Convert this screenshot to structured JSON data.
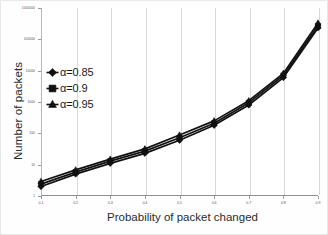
{
  "chart_data": {
    "type": "line",
    "title": "",
    "xlabel": "Probability of  packet  changed",
    "ylabel": "Number of packets",
    "x": [
      0.1,
      0.2,
      0.3,
      0.4,
      0.5,
      0.6,
      0.7,
      0.8,
      0.9
    ],
    "xtick_labels": [
      "0.1",
      "0.2",
      "0.3",
      "0.4",
      "0.5",
      "0.6",
      "0.7",
      "0.8",
      "0.9"
    ],
    "ytick_labels": [
      "1000000",
      "100000",
      "10000",
      "1000",
      "100",
      "10",
      "1"
    ],
    "ytick_values": [
      1000000,
      100000,
      10000,
      1000,
      100,
      10,
      1
    ],
    "yscale": "log",
    "ylim": [
      1,
      1000000
    ],
    "xlim": [
      0.1,
      0.9
    ],
    "grid": "vertical",
    "legend_position": "upper-left-inside",
    "series": [
      {
        "name": "α=0.85",
        "marker": "diamond",
        "color": "#111111",
        "values": [
          2.0,
          5.0,
          11.0,
          23.0,
          60.0,
          180.0,
          800.0,
          6000.0,
          230000.0
        ]
      },
      {
        "name": "α=0.9",
        "marker": "square",
        "color": "#111111",
        "values": [
          2.4,
          5.8,
          13.0,
          27.0,
          72.0,
          210.0,
          950.0,
          7000.0,
          270000.0
        ]
      },
      {
        "name": "α=0.95",
        "marker": "triangle",
        "color": "#111111",
        "values": [
          2.9,
          6.8,
          15.0,
          32.0,
          88.0,
          250.0,
          1100.0,
          8200.0,
          330000.0
        ]
      }
    ]
  },
  "legend": {
    "items": [
      {
        "label": "α=0.85",
        "marker": "diamond"
      },
      {
        "label": "α=0.9",
        "marker": "square"
      },
      {
        "label": "α=0.95",
        "marker": "triangle"
      }
    ]
  },
  "axes": {
    "x_title": "Probability of  packet  changed",
    "y_title": "Number of packets"
  }
}
